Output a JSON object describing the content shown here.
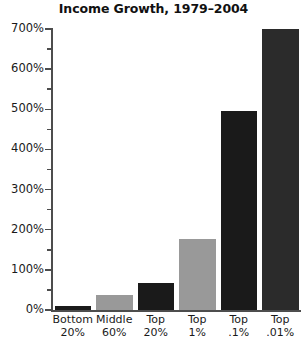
{
  "chart_data": {
    "type": "bar",
    "title": "Income Growth, 1979–2004",
    "xlabel": "",
    "ylabel": "",
    "ylim": [
      0,
      700
    ],
    "grid": false,
    "legend": "none",
    "ytick_labels": [
      "0%",
      "100%",
      "200%",
      "300%",
      "400%",
      "500%",
      "600%",
      "700%"
    ],
    "ytick_values": [
      0,
      100,
      200,
      300,
      400,
      500,
      600,
      700
    ],
    "yminor_values": [
      50,
      150,
      250,
      350,
      450,
      550,
      650
    ],
    "categories": [
      "Bottom 20%",
      "Middle 60%",
      "Top 20%",
      "Top 1%",
      "Top .1%",
      "Top .01%"
    ],
    "category_lines": [
      [
        "Bottom",
        "20%"
      ],
      [
        "Middle",
        "60%"
      ],
      [
        "Top",
        "20%"
      ],
      [
        "Top",
        "1%"
      ],
      [
        "Top",
        ".1%"
      ],
      [
        "Top",
        ".01%"
      ]
    ],
    "values": [
      9,
      37,
      68,
      178,
      497,
      700
    ],
    "bar_colors": [
      "#1a1a1a",
      "#999999",
      "#1a1a1a",
      "#999999",
      "#1a1a1a",
      "#2b2b2b"
    ]
  },
  "colors": {
    "dark_bar": "#1a1a1a",
    "gray_bar": "#999999",
    "axis": "#4d4d4d",
    "text": "#1a1a1a",
    "background": "#ffffff"
  }
}
